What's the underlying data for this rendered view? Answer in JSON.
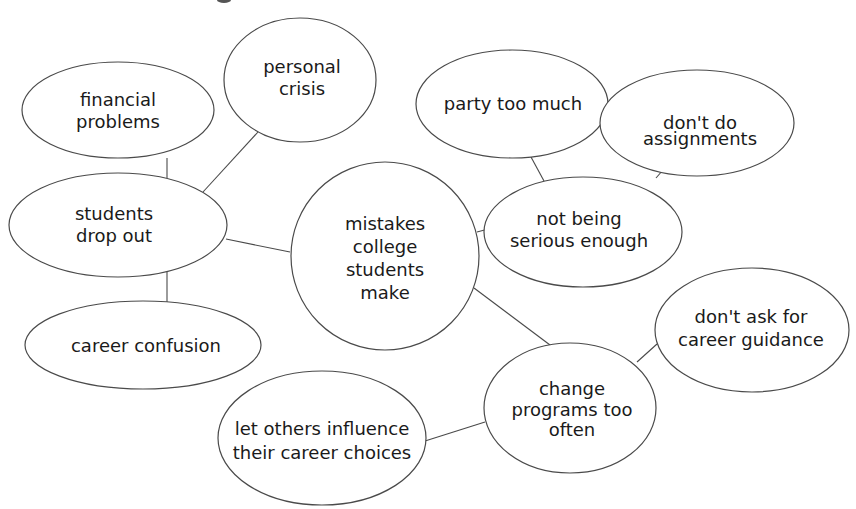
{
  "diagram": {
    "type": "mind-map",
    "style": {
      "stroke_color": "#4a4a4a",
      "text_color": "#1a1a1a",
      "background": "#ffffff"
    },
    "center": {
      "id": "mistakes",
      "lines": [
        "mistakes",
        "college",
        "students",
        "make"
      ]
    },
    "nodes": [
      {
        "id": "financial",
        "lines": [
          "financial",
          "problems"
        ]
      },
      {
        "id": "personal",
        "lines": [
          "personal",
          "crisis"
        ]
      },
      {
        "id": "dropout",
        "lines": [
          "students",
          "drop out"
        ]
      },
      {
        "id": "confusion",
        "lines": [
          "career confusion"
        ]
      },
      {
        "id": "party",
        "lines": [
          "party too much"
        ]
      },
      {
        "id": "assignments",
        "lines": [
          "don't do",
          "assignments"
        ]
      },
      {
        "id": "serious",
        "lines": [
          "not being",
          "serious enough"
        ]
      },
      {
        "id": "guidance",
        "lines": [
          "don't ask for",
          "career guidance"
        ]
      },
      {
        "id": "change",
        "lines": [
          "change",
          "programs too",
          "often"
        ]
      },
      {
        "id": "influence",
        "lines": [
          "let others influence",
          "their career choices"
        ]
      }
    ],
    "edges": [
      [
        "mistakes",
        "dropout"
      ],
      [
        "mistakes",
        "serious"
      ],
      [
        "mistakes",
        "change"
      ],
      [
        "dropout",
        "financial"
      ],
      [
        "dropout",
        "personal"
      ],
      [
        "dropout",
        "confusion"
      ],
      [
        "serious",
        "party"
      ],
      [
        "serious",
        "assignments"
      ],
      [
        "change",
        "guidance"
      ],
      [
        "change",
        "influence"
      ]
    ]
  }
}
